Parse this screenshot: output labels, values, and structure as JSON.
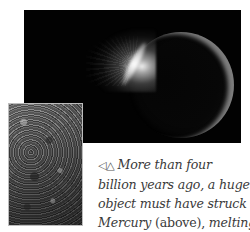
{
  "figures": {
    "top_image": {
      "subject": "Mercury struck by huge object, impact flash on upper-left limb",
      "icon": "planet-impact-image"
    },
    "bottom_image": {
      "subject": "cratered surface of Mercury",
      "icon": "cratered-surface-image"
    }
  },
  "caption": {
    "pointer_symbols": "◁△",
    "lines": [
      {
        "italic": "More than four",
        "roman": "",
        "italic2": ""
      },
      {
        "italic": "billion years ago, a huge",
        "roman": "",
        "italic2": ""
      },
      {
        "italic": "object must have struck",
        "roman": "",
        "italic2": ""
      },
      {
        "italic": "Mercury",
        "roman": " (above), ",
        "italic2": "melting"
      }
    ]
  }
}
